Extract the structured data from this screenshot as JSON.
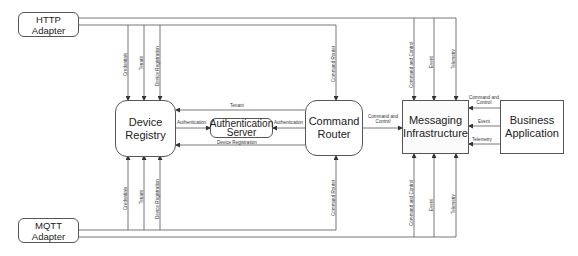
{
  "nodes": {
    "http_adapter": "HTTP Adapter",
    "mqtt_adapter": "MQTT Adapter",
    "device_registry": "Device Registry",
    "authentication_server": "Authentication Server",
    "command_router": "Command Router",
    "messaging_infrastructure": "Messaging Infrastructure",
    "business_application": "Business Application"
  },
  "edges": {
    "http_credentials": "Credentials",
    "http_tenant": "Tenant",
    "http_device_registration": "Device Registration",
    "http_command_router": "Command Router",
    "http_command_and_control": "Command and Control",
    "http_event": "Event",
    "http_telemetry": "Telemetry",
    "mqtt_credentials": "Credentials",
    "mqtt_tenant": "Tenant",
    "mqtt_device_registration": "Device Registration",
    "mqtt_command_router": "Command Router",
    "mqtt_command_and_control": "Command and Control",
    "mqtt_event": "Event",
    "mqtt_telemetry": "Telemetry",
    "router_registry_tenant": "Tenant",
    "registry_auth": "Authentication",
    "router_auth": "Authentication",
    "router_registry_device_registration": "Device Registration",
    "router_messaging": "Command and Control",
    "business_command_and_control": "Command and Control",
    "business_event": "Event",
    "business_telemetry": "Telemetry"
  }
}
